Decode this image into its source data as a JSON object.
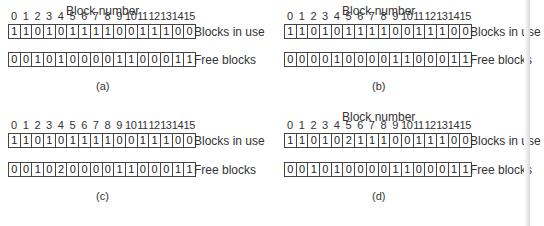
{
  "header_label": "Block number",
  "block_numbers": [
    "0",
    "1",
    "2",
    "3",
    "4",
    "5",
    "6",
    "7",
    "8",
    "9",
    "10",
    "11",
    "12",
    "13",
    "14",
    "15"
  ],
  "in_use_label": "Blocks in use",
  "free_label": "Free blocks",
  "panels": [
    {
      "caption": "(a)",
      "show_header": true,
      "in_use": [
        "1",
        "1",
        "0",
        "1",
        "0",
        "1",
        "1",
        "1",
        "1",
        "0",
        "0",
        "1",
        "1",
        "1",
        "0",
        "0"
      ],
      "free": [
        "0",
        "0",
        "1",
        "0",
        "1",
        "0",
        "0",
        "0",
        "0",
        "1",
        "1",
        "0",
        "0",
        "0",
        "1",
        "1"
      ]
    },
    {
      "caption": "(b)",
      "show_header": true,
      "in_use": [
        "1",
        "1",
        "0",
        "1",
        "0",
        "1",
        "1",
        "1",
        "1",
        "0",
        "0",
        "1",
        "1",
        "1",
        "0",
        "0"
      ],
      "free": [
        "0",
        "0",
        "0",
        "0",
        "1",
        "0",
        "0",
        "0",
        "0",
        "1",
        "1",
        "0",
        "0",
        "0",
        "1",
        "1"
      ]
    },
    {
      "caption": "(c)",
      "show_header": false,
      "in_use": [
        "1",
        "1",
        "0",
        "1",
        "0",
        "1",
        "1",
        "1",
        "1",
        "0",
        "0",
        "1",
        "1",
        "1",
        "0",
        "0"
      ],
      "free": [
        "0",
        "0",
        "1",
        "0",
        "2",
        "0",
        "0",
        "0",
        "0",
        "1",
        "1",
        "0",
        "0",
        "0",
        "1",
        "1"
      ]
    },
    {
      "caption": "(d)",
      "show_header": true,
      "in_use": [
        "1",
        "1",
        "0",
        "1",
        "0",
        "2",
        "1",
        "1",
        "1",
        "0",
        "0",
        "1",
        "1",
        "1",
        "0",
        "0"
      ],
      "free": [
        "0",
        "0",
        "1",
        "0",
        "1",
        "0",
        "0",
        "0",
        "0",
        "1",
        "1",
        "0",
        "0",
        "0",
        "1",
        "1"
      ]
    }
  ]
}
